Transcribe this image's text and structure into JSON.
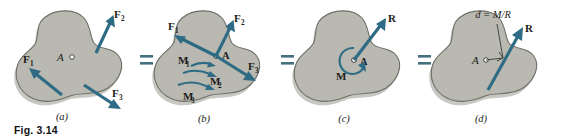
{
  "figure": {
    "caption": "Fig. 3.14",
    "equals_sign": "=",
    "panels": [
      {
        "id": "a",
        "label": "(a)",
        "point_label": "A",
        "force_labels": [
          {
            "base": "F",
            "sub": "1"
          },
          {
            "base": "F",
            "sub": "2"
          },
          {
            "base": "F",
            "sub": "3"
          }
        ]
      },
      {
        "id": "b",
        "label": "(b)",
        "point_label": "A",
        "force_labels": [
          {
            "base": "F",
            "sub": "1"
          },
          {
            "base": "F",
            "sub": "2"
          },
          {
            "base": "F",
            "sub": "3"
          }
        ],
        "moment_labels": [
          {
            "base": "M",
            "sub": "1"
          },
          {
            "base": "M",
            "sub": "2"
          },
          {
            "base": "M",
            "sub": "3"
          }
        ]
      },
      {
        "id": "c",
        "label": "(c)",
        "point_label": "A",
        "resultant_label": "R",
        "moment_label": "M"
      },
      {
        "id": "d",
        "label": "(d)",
        "point_label": "A",
        "resultant_label": "R",
        "dimension_label": "d = M/R"
      }
    ]
  },
  "colors": {
    "vector_blue": "#2e6b84",
    "body_fill": "#b9b9b1",
    "body_outline": "#6f6f68",
    "text": "#1c1c1a",
    "background": "#ffffff"
  }
}
